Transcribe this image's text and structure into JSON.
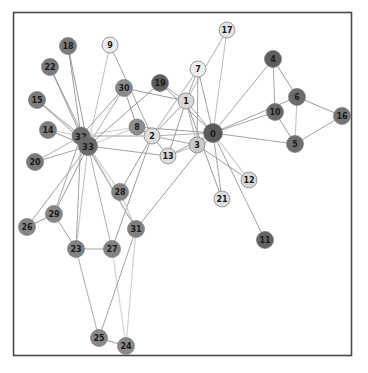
{
  "figure": {
    "title": "",
    "background_color": "#ffffff",
    "border_color": "#4a4a4a",
    "border": {
      "x": 13,
      "y": 12,
      "width": 339,
      "height": 344
    },
    "width": 368,
    "height": 373
  },
  "chart_data": {
    "type": "network-graph",
    "xlabel": "",
    "ylabel": "",
    "grid": false,
    "legend": "none",
    "node_count": 34,
    "edge_count": 78,
    "node_radius": 8.5,
    "label_color": "#1a1a1a",
    "edge_color": "#888888",
    "node_outline_color": "#777777",
    "colormap": "grayscale (dark = high degree / group A, light = low degree / group B)",
    "nodes": [
      {
        "id": "0",
        "x": 213,
        "y": 133,
        "r": 9.5,
        "color": "#5a5a5a",
        "fontsize": 8.5
      },
      {
        "id": "1",
        "x": 186,
        "y": 101,
        "r": 8.0,
        "color": "#d8d8d8",
        "fontsize": 8
      },
      {
        "id": "2",
        "x": 152,
        "y": 136,
        "r": 8.0,
        "color": "#dedede",
        "fontsize": 8
      },
      {
        "id": "3",
        "x": 197,
        "y": 145,
        "r": 8.0,
        "color": "#c9c9c9",
        "fontsize": 8
      },
      {
        "id": "4",
        "x": 273,
        "y": 59,
        "r": 8.5,
        "color": "#5f5f5f",
        "fontsize": 8
      },
      {
        "id": "5",
        "x": 295,
        "y": 144,
        "r": 8.5,
        "color": "#6e6e6e",
        "fontsize": 8
      },
      {
        "id": "6",
        "x": 297,
        "y": 97,
        "r": 8.5,
        "color": "#6c6c6c",
        "fontsize": 8
      },
      {
        "id": "7",
        "x": 198,
        "y": 69,
        "r": 8.0,
        "color": "#ededed",
        "fontsize": 8
      },
      {
        "id": "8",
        "x": 137,
        "y": 127,
        "r": 8.0,
        "color": "#8e8e8e",
        "fontsize": 8
      },
      {
        "id": "9",
        "x": 110,
        "y": 45,
        "r": 8.0,
        "color": "#ebebeb",
        "fontsize": 8
      },
      {
        "id": "10",
        "x": 275,
        "y": 112,
        "r": 8.5,
        "color": "#6a6a6a",
        "fontsize": 8
      },
      {
        "id": "11",
        "x": 265,
        "y": 240,
        "r": 8.5,
        "color": "#636363",
        "fontsize": 8
      },
      {
        "id": "12",
        "x": 249,
        "y": 180,
        "r": 8.0,
        "color": "#d6d6d6",
        "fontsize": 8
      },
      {
        "id": "13",
        "x": 168,
        "y": 156,
        "r": 8.0,
        "color": "#dcdcdc",
        "fontsize": 8
      },
      {
        "id": "14",
        "x": 48,
        "y": 130,
        "r": 8.5,
        "color": "#7d7d7d",
        "fontsize": 8
      },
      {
        "id": "15",
        "x": 37,
        "y": 100,
        "r": 8.5,
        "color": "#7d7d7d",
        "fontsize": 8
      },
      {
        "id": "16",
        "x": 342,
        "y": 116,
        "r": 8.5,
        "color": "#757575",
        "fontsize": 8
      },
      {
        "id": "17",
        "x": 227,
        "y": 30,
        "r": 8.0,
        "color": "#e3e3e3",
        "fontsize": 8
      },
      {
        "id": "18",
        "x": 68,
        "y": 46,
        "r": 8.5,
        "color": "#7a7a7a",
        "fontsize": 8
      },
      {
        "id": "19",
        "x": 160,
        "y": 83,
        "r": 8.5,
        "color": "#5d5d5d",
        "fontsize": 8
      },
      {
        "id": "20",
        "x": 35,
        "y": 162,
        "r": 8.5,
        "color": "#787878",
        "fontsize": 8
      },
      {
        "id": "21",
        "x": 222,
        "y": 199,
        "r": 8.0,
        "color": "#dddddd",
        "fontsize": 8
      },
      {
        "id": "22",
        "x": 50,
        "y": 67,
        "r": 8.5,
        "color": "#7b7b7b",
        "fontsize": 8
      },
      {
        "id": "23",
        "x": 76,
        "y": 249,
        "r": 8.5,
        "color": "#828282",
        "fontsize": 8
      },
      {
        "id": "24",
        "x": 126,
        "y": 346,
        "r": 8.5,
        "color": "#8a8a8a",
        "fontsize": 8
      },
      {
        "id": "25",
        "x": 99,
        "y": 338,
        "r": 8.5,
        "color": "#888888",
        "fontsize": 8
      },
      {
        "id": "26",
        "x": 27,
        "y": 227,
        "r": 8.5,
        "color": "#858585",
        "fontsize": 8
      },
      {
        "id": "27",
        "x": 112,
        "y": 249,
        "r": 8.5,
        "color": "#838383",
        "fontsize": 8
      },
      {
        "id": "28",
        "x": 120,
        "y": 192,
        "r": 8.5,
        "color": "#848484",
        "fontsize": 8
      },
      {
        "id": "29",
        "x": 54,
        "y": 214,
        "r": 8.5,
        "color": "#868686",
        "fontsize": 8
      },
      {
        "id": "30",
        "x": 124,
        "y": 88,
        "r": 8.5,
        "color": "#8b8b8b",
        "fontsize": 8
      },
      {
        "id": "31",
        "x": 136,
        "y": 229,
        "r": 8.5,
        "color": "#818181",
        "fontsize": 8
      },
      {
        "id": "32",
        "x": 81,
        "y": 136,
        "r": 9.0,
        "color": "#6f6f6f",
        "fontsize": 8.5
      },
      {
        "id": "33",
        "x": 88,
        "y": 146,
        "r": 9.5,
        "color": "#6b6b6b",
        "fontsize": 8.5
      }
    ],
    "edges": [
      [
        "0",
        "1"
      ],
      [
        "0",
        "2"
      ],
      [
        "0",
        "3"
      ],
      [
        "0",
        "4"
      ],
      [
        "0",
        "5"
      ],
      [
        "0",
        "6"
      ],
      [
        "0",
        "7"
      ],
      [
        "0",
        "8"
      ],
      [
        "0",
        "10"
      ],
      [
        "0",
        "11"
      ],
      [
        "0",
        "12"
      ],
      [
        "0",
        "13"
      ],
      [
        "0",
        "17"
      ],
      [
        "0",
        "19"
      ],
      [
        "0",
        "21"
      ],
      [
        "0",
        "31"
      ],
      [
        "1",
        "2"
      ],
      [
        "1",
        "3"
      ],
      [
        "1",
        "7"
      ],
      [
        "1",
        "13"
      ],
      [
        "1",
        "17"
      ],
      [
        "1",
        "19"
      ],
      [
        "1",
        "21"
      ],
      [
        "1",
        "30"
      ],
      [
        "2",
        "3"
      ],
      [
        "2",
        "7"
      ],
      [
        "2",
        "8"
      ],
      [
        "2",
        "9"
      ],
      [
        "2",
        "13"
      ],
      [
        "2",
        "27"
      ],
      [
        "2",
        "28"
      ],
      [
        "2",
        "32"
      ],
      [
        "3",
        "7"
      ],
      [
        "3",
        "12"
      ],
      [
        "3",
        "13"
      ],
      [
        "4",
        "6"
      ],
      [
        "4",
        "10"
      ],
      [
        "5",
        "6"
      ],
      [
        "5",
        "10"
      ],
      [
        "5",
        "16"
      ],
      [
        "6",
        "16"
      ],
      [
        "8",
        "30"
      ],
      [
        "8",
        "32"
      ],
      [
        "8",
        "33"
      ],
      [
        "9",
        "33"
      ],
      [
        "13",
        "33"
      ],
      [
        "14",
        "32"
      ],
      [
        "14",
        "33"
      ],
      [
        "15",
        "32"
      ],
      [
        "15",
        "33"
      ],
      [
        "18",
        "32"
      ],
      [
        "18",
        "33"
      ],
      [
        "19",
        "33"
      ],
      [
        "20",
        "32"
      ],
      [
        "20",
        "33"
      ],
      [
        "22",
        "32"
      ],
      [
        "22",
        "33"
      ],
      [
        "23",
        "25"
      ],
      [
        "23",
        "27"
      ],
      [
        "23",
        "29"
      ],
      [
        "23",
        "32"
      ],
      [
        "23",
        "33"
      ],
      [
        "24",
        "25"
      ],
      [
        "24",
        "27"
      ],
      [
        "24",
        "31"
      ],
      [
        "25",
        "31"
      ],
      [
        "26",
        "29"
      ],
      [
        "26",
        "33"
      ],
      [
        "27",
        "33"
      ],
      [
        "28",
        "31"
      ],
      [
        "28",
        "33"
      ],
      [
        "29",
        "32"
      ],
      [
        "29",
        "33"
      ],
      [
        "30",
        "32"
      ],
      [
        "30",
        "33"
      ],
      [
        "31",
        "32"
      ],
      [
        "31",
        "33"
      ],
      [
        "32",
        "33"
      ]
    ]
  }
}
